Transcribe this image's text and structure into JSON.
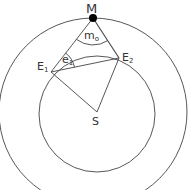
{
  "diagram": {
    "type": "geometric-construction",
    "colors": {
      "stroke": "#444444",
      "text": "#333333",
      "point": "#000000",
      "background": "#ffffff"
    },
    "circles": [
      {
        "name": "outer-circle",
        "cx": 93,
        "cy": 112,
        "r": 94
      },
      {
        "name": "inner-circle",
        "cx": 97,
        "cy": 114,
        "r": 58
      }
    ],
    "points": {
      "M": {
        "label": "M",
        "x": 93,
        "y": 18
      },
      "E1": {
        "label": "E",
        "sub": "1",
        "x": 51,
        "y": 72
      },
      "E2": {
        "label": "E",
        "sub": "2",
        "x": 119,
        "y": 58
      },
      "S": {
        "label": "S",
        "x": 97,
        "y": 112
      }
    },
    "segments": [
      [
        "M",
        "E1"
      ],
      [
        "M",
        "E2"
      ],
      [
        "E1",
        "E2"
      ],
      [
        "E1",
        "S"
      ],
      [
        "E2",
        "S"
      ]
    ],
    "angles": {
      "m0": {
        "label": "m",
        "sub": "o",
        "vertex": "M"
      },
      "e1": {
        "label": "e",
        "sub": "1",
        "vertex": "E1"
      }
    }
  }
}
